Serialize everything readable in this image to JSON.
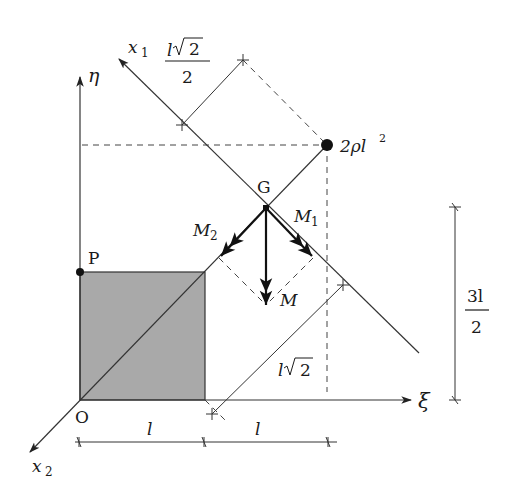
{
  "figure": {
    "colors": {
      "line": "#333333",
      "plate_fill": "#a9a9a9",
      "background": "#ffffff"
    }
  },
  "axes": {
    "eta": {
      "label": "η"
    },
    "xi": {
      "label": "ξ"
    },
    "x1": {
      "label": "x",
      "sub": "1"
    },
    "x2": {
      "label": "x",
      "sub": "2"
    }
  },
  "points": {
    "origin": {
      "label": "O"
    },
    "p": {
      "label": "P"
    },
    "g": {
      "label": "G"
    },
    "mass": {
      "label_prefix": "2ρl",
      "label_sup": "2"
    }
  },
  "vectors": {
    "m1": {
      "label": "M",
      "sub": "1"
    },
    "m2": {
      "label": "M",
      "sub": "2"
    },
    "m": {
      "label": "M"
    }
  },
  "dimensions": {
    "top_diag": {
      "num_l": "l",
      "num_rad": "2",
      "den": "2"
    },
    "right_vertical": {
      "num": "3l",
      "den": "2"
    },
    "lower_diag": {
      "l": "l",
      "rad": "2"
    },
    "bottom_left": {
      "label": "l"
    },
    "bottom_right": {
      "label": "l"
    }
  }
}
